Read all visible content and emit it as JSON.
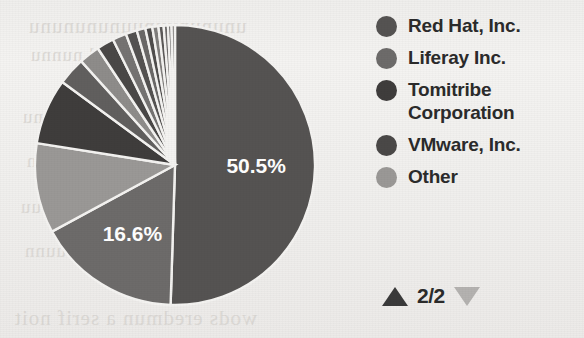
{
  "chart_data": {
    "type": "pie",
    "title": "",
    "legend_position": "right",
    "grid": false,
    "categories": [
      "Red Hat, Inc.",
      "Liferay Inc.",
      "Tomitribe Corporation",
      "VMware, Inc.",
      "Other"
    ],
    "values": [
      50.5,
      16.6,
      9.2,
      7.4,
      16.3
    ],
    "labels_shown": [
      "50.5%",
      "16.6%"
    ],
    "slices": [
      {
        "name": "Red Hat, Inc.",
        "value": 50.5,
        "label": "50.5%",
        "color": "#555352",
        "label_shown": true
      },
      {
        "name": "Liferay Inc.",
        "value": 16.6,
        "label": "16.6%",
        "color": "#6d6b6a",
        "label_shown": true
      },
      {
        "name": "Other",
        "value": 10.4,
        "label": "",
        "color": "#9a9896",
        "label_shown": false
      },
      {
        "name": "Tomitribe Corporation",
        "value": 7.6,
        "label": "",
        "color": "#3f3d3c",
        "label_shown": false
      },
      {
        "name": "VMware, Inc.",
        "value": 3.2,
        "label": "",
        "color": "#615f5e",
        "label_shown": false
      },
      {
        "name": "slice-6",
        "value": 2.4,
        "label": "",
        "color": "#8e8c8a",
        "label_shown": false
      },
      {
        "name": "slice-7",
        "value": 2.0,
        "label": "",
        "color": "#4a4847",
        "label_shown": false
      },
      {
        "name": "slice-8",
        "value": 1.6,
        "label": "",
        "color": "#757372",
        "label_shown": false
      },
      {
        "name": "slice-9",
        "value": 1.3,
        "label": "",
        "color": "#545251",
        "label_shown": false
      },
      {
        "name": "slice-10",
        "value": 1.0,
        "label": "",
        "color": "#6a6867",
        "label_shown": false
      },
      {
        "name": "slice-11",
        "value": 0.8,
        "label": "",
        "color": "#4f4d4c",
        "label_shown": false
      },
      {
        "name": "slice-12",
        "value": 0.7,
        "label": "",
        "color": "#807e7c",
        "label_shown": false
      },
      {
        "name": "slice-13",
        "value": 0.6,
        "label": "",
        "color": "#5b5958",
        "label_shown": false
      },
      {
        "name": "slice-14",
        "value": 0.5,
        "label": "",
        "color": "#6f6d6c",
        "label_shown": false
      },
      {
        "name": "slice-15",
        "value": 0.4,
        "label": "",
        "color": "#4d4b4a",
        "label_shown": false
      },
      {
        "name": "slice-16",
        "value": 0.4,
        "label": "",
        "color": "#7b7978",
        "label_shown": false
      }
    ]
  },
  "pie": {
    "label_a": "50.5%",
    "label_b": "16.6%",
    "label_color": "#ffffff",
    "separator_color": "#f4f3f1"
  },
  "legend": {
    "items": [
      {
        "label": "Red Hat, Inc.",
        "color": "#555352"
      },
      {
        "label": "Liferay Inc.",
        "color": "#6d6b6a"
      },
      {
        "label": "Tomitribe Corporation",
        "color": "#3f3d3c"
      },
      {
        "label": "VMware, Inc.",
        "color": "#4a4847"
      },
      {
        "label": "Other",
        "color": "#9a9896"
      }
    ]
  },
  "pager": {
    "count": "2/2",
    "up_icon": "triangle-up-icon",
    "down_icon": "triangle-down-icon",
    "up_color": "#3a3a3a",
    "down_color": "#b4b2b0"
  },
  "background_bleed": {
    "line_top_1": "unununuunuununununu",
    "line_top_2": "nn  und  nunnu",
    "line_mid_1": "uuunn  nuunnu",
    "line_mid_2": "nun  uuunn",
    "line_mid_3": "uunnuu  nnuu",
    "line_mid_4": "nnuunn  uunn",
    "line_bottom_1": "wods eredmun a serif noit"
  }
}
